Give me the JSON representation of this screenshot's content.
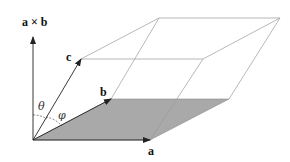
{
  "diagram": {
    "type": "parallelepiped",
    "labels": {
      "cross": "a × b",
      "a": "a",
      "b": "b",
      "c": "c",
      "theta": "θ",
      "phi": "φ"
    },
    "colors": {
      "base_fill": "#a9a9a9",
      "edge": "#8a8a8a",
      "vector": "#222222"
    }
  }
}
